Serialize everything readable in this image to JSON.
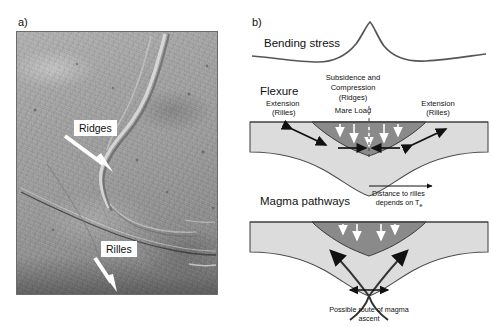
{
  "figure": {
    "panel_a": {
      "tag": "a)",
      "kind": "spacecraft-photograph",
      "annotations": [
        {
          "label": "Ridges",
          "arrow": "points down-right to wrinkle ridge"
        },
        {
          "label": "Rilles",
          "arrow": "points down-right to graben rille"
        }
      ]
    },
    "panel_b": {
      "tag": "b)",
      "kind": "schematic-cross-section",
      "stress_curve": {
        "label": "Bending stress",
        "description": "flexural bending stress profile with central peak and flanking troughs"
      },
      "flexure": {
        "title": "Flexure",
        "left": {
          "line1": "Extension",
          "line2": "(Rilles)"
        },
        "right": {
          "line1": "Extension",
          "line2": "(Rilles)"
        },
        "center": {
          "line1": "Subsidence and",
          "line2": "Compression",
          "line3": "(Ridges)"
        },
        "load_label": "Mare Load",
        "distance_note": {
          "line1": "Distance to rilles",
          "line2": "depends on T",
          "subscript": "e"
        }
      },
      "magma": {
        "title": "Magma pathways",
        "caption": {
          "line1": "Possible route of magma",
          "line2": "ascent"
        }
      }
    },
    "colors": {
      "crust_fill": "#dcdcdc",
      "mare_fill": "#8a8a8a",
      "stroke": "#3a3a3a",
      "arrow_dark": "#111111",
      "arrow_light": "#ffffff",
      "background": "#ffffff"
    }
  }
}
